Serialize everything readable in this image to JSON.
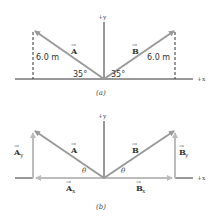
{
  "panel_a": {
    "caption": "(a)",
    "axis_y_label": "+y",
    "axis_x_label": "+x",
    "vector_A_label": "A",
    "vector_B_label": "B",
    "magnitude_A": "6.0 m",
    "magnitude_B": "6.0 m",
    "angle_A": "35°",
    "angle_B": "35°"
  },
  "panel_b": {
    "caption": "(b)",
    "axis_y_label": "+y",
    "axis_x_label": "+x",
    "vector_A_label": "A",
    "vector_B_label": "B",
    "component_Ay": "A",
    "component_Ay_sub": "y",
    "component_Ax": "A",
    "component_Ax_sub": "x",
    "component_By": "B",
    "component_By_sub": "y",
    "component_Bx": "B",
    "component_Bx_sub": "x",
    "angle_A": "θ",
    "angle_B": "θ"
  },
  "colors": {
    "axis": "#333333",
    "vector": "#9a9a9a",
    "component": "#b8b8b8",
    "dashed": "#333333"
  }
}
